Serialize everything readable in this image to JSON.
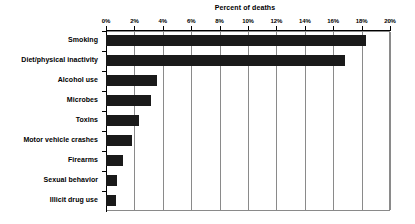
{
  "chart_data": {
    "type": "bar",
    "orientation": "horizontal",
    "title": "Percent of deaths",
    "xlabel": "",
    "ylabel": "",
    "xlim": [
      0,
      20
    ],
    "xtick_labels": [
      "0%",
      "2%",
      "4%",
      "6%",
      "8%",
      "10%",
      "12%",
      "14%",
      "16%",
      "18%",
      "20%"
    ],
    "xtick_values": [
      0,
      2,
      4,
      6,
      8,
      10,
      12,
      14,
      16,
      18,
      20
    ],
    "grid": true,
    "legend": false,
    "bar_color": "#1a1a1a",
    "categories": [
      "Smoking",
      "Diet/physical inactivity",
      "Alcohol use",
      "Microbes",
      "Toxins",
      "Motor vehicle crashes",
      "Firearms",
      "Sexual behavior",
      "Illicit drug use"
    ],
    "values": [
      18.3,
      16.8,
      3.6,
      3.2,
      2.3,
      1.8,
      1.2,
      0.8,
      0.7
    ]
  }
}
